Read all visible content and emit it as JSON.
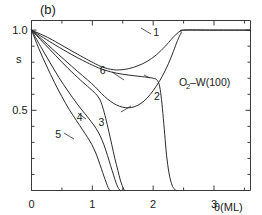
{
  "panel": {
    "label": "(b)"
  },
  "annotation": {
    "pre": "O",
    "sub": "2",
    "post": "–W(100)"
  },
  "axes": {
    "x": {
      "title": "θ(ML)",
      "ticks": [
        0,
        1,
        2,
        3
      ],
      "tick_labels": [
        "0",
        "1",
        "2",
        "3"
      ],
      "minor_ticks": [
        0.5,
        1.5,
        2.5,
        3.5
      ],
      "range": [
        0,
        3.6
      ]
    },
    "y": {
      "title": "s",
      "ticks": [
        0.5,
        1.0
      ],
      "tick_labels": [
        "0.5",
        "1.0"
      ],
      "minor_ticks": [
        0.1,
        0.2,
        0.3,
        0.4,
        0.6,
        0.7,
        0.8,
        0.9
      ],
      "range": [
        0,
        1.06
      ]
    }
  },
  "chart_data": {
    "type": "line",
    "title": "",
    "subtitle": "(b)",
    "xlabel": "θ(ML)",
    "ylabel": "s",
    "xlim": [
      0,
      3.6
    ],
    "ylim": [
      0,
      1.06
    ],
    "grid": false,
    "legend": "inline-curve-labels",
    "annotations": [
      "O2–W(100)",
      "(b)"
    ],
    "series": [
      {
        "name": "1",
        "label": "1",
        "label_x": 2.05,
        "label_y": 0.965,
        "points": [
          [
            0.0,
            1.0
          ],
          [
            0.15,
            0.975
          ],
          [
            0.3,
            0.948
          ],
          [
            0.5,
            0.905
          ],
          [
            0.7,
            0.862
          ],
          [
            0.9,
            0.82
          ],
          [
            1.05,
            0.79
          ],
          [
            1.15,
            0.772
          ],
          [
            1.25,
            0.76
          ],
          [
            1.35,
            0.753
          ],
          [
            1.45,
            0.752
          ],
          [
            1.6,
            0.76
          ],
          [
            1.75,
            0.778
          ],
          [
            1.9,
            0.805
          ],
          [
            2.05,
            0.845
          ],
          [
            2.2,
            0.9
          ],
          [
            2.3,
            0.943
          ],
          [
            2.38,
            0.975
          ],
          [
            2.45,
            0.995
          ],
          [
            2.5,
            1.0
          ],
          [
            3.0,
            1.0
          ],
          [
            3.6,
            1.0
          ]
        ]
      },
      {
        "name": "2",
        "label": "2",
        "label_x": 2.06,
        "label_y": 0.565,
        "points": [
          [
            0.0,
            1.0
          ],
          [
            0.2,
            0.952
          ],
          [
            0.4,
            0.905
          ],
          [
            0.65,
            0.85
          ],
          [
            0.9,
            0.8
          ],
          [
            1.1,
            0.765
          ],
          [
            1.3,
            0.74
          ],
          [
            1.5,
            0.725
          ],
          [
            1.7,
            0.715
          ],
          [
            1.9,
            0.706
          ],
          [
            2.0,
            0.7
          ],
          [
            2.06,
            0.69
          ],
          [
            2.1,
            0.66
          ],
          [
            2.13,
            0.59
          ],
          [
            2.16,
            0.48
          ],
          [
            2.19,
            0.35
          ],
          [
            2.22,
            0.22
          ],
          [
            2.26,
            0.11
          ],
          [
            2.3,
            0.045
          ],
          [
            2.34,
            0.012
          ],
          [
            2.38,
            0.0
          ]
        ]
      },
      {
        "name": "3",
        "label": "3",
        "label_x": 1.15,
        "label_y": 0.4,
        "points": [
          [
            0.0,
            1.0
          ],
          [
            0.2,
            0.92
          ],
          [
            0.4,
            0.84
          ],
          [
            0.6,
            0.762
          ],
          [
            0.8,
            0.69
          ],
          [
            0.95,
            0.64
          ],
          [
            1.05,
            0.605
          ],
          [
            1.12,
            0.57
          ],
          [
            1.17,
            0.52
          ],
          [
            1.22,
            0.45
          ],
          [
            1.27,
            0.37
          ],
          [
            1.32,
            0.285
          ],
          [
            1.37,
            0.2
          ],
          [
            1.42,
            0.125
          ],
          [
            1.46,
            0.065
          ],
          [
            1.5,
            0.022
          ],
          [
            1.53,
            0.0
          ]
        ]
      },
      {
        "name": "4",
        "label": "4",
        "label_x": 0.79,
        "label_y": 0.435,
        "points": [
          [
            0.0,
            1.0
          ],
          [
            0.15,
            0.898
          ],
          [
            0.3,
            0.8
          ],
          [
            0.45,
            0.705
          ],
          [
            0.6,
            0.62
          ],
          [
            0.75,
            0.54
          ],
          [
            0.88,
            0.478
          ],
          [
            0.98,
            0.43
          ],
          [
            1.06,
            0.388
          ],
          [
            1.13,
            0.34
          ],
          [
            1.19,
            0.285
          ],
          [
            1.25,
            0.218
          ],
          [
            1.3,
            0.155
          ],
          [
            1.35,
            0.095
          ],
          [
            1.39,
            0.048
          ],
          [
            1.43,
            0.013
          ],
          [
            1.46,
            0.0
          ]
        ]
      },
      {
        "name": "5",
        "label": "5",
        "label_x": 0.44,
        "label_y": 0.33,
        "points": [
          [
            0.0,
            1.0
          ],
          [
            0.12,
            0.885
          ],
          [
            0.25,
            0.775
          ],
          [
            0.38,
            0.672
          ],
          [
            0.5,
            0.585
          ],
          [
            0.62,
            0.505
          ],
          [
            0.74,
            0.435
          ],
          [
            0.84,
            0.378
          ],
          [
            0.92,
            0.332
          ],
          [
            0.99,
            0.288
          ],
          [
            1.05,
            0.24
          ],
          [
            1.1,
            0.19
          ],
          [
            1.15,
            0.135
          ],
          [
            1.19,
            0.09
          ],
          [
            1.23,
            0.048
          ],
          [
            1.26,
            0.018
          ],
          [
            1.29,
            0.0
          ]
        ]
      },
      {
        "name": "6",
        "label": "6",
        "label_x": 1.17,
        "label_y": 0.725,
        "points": [
          [
            0.0,
            1.0
          ],
          [
            0.18,
            0.94
          ],
          [
            0.35,
            0.88
          ],
          [
            0.55,
            0.812
          ],
          [
            0.75,
            0.745
          ],
          [
            0.92,
            0.69
          ],
          [
            1.05,
            0.645
          ],
          [
            1.15,
            0.605
          ],
          [
            1.25,
            0.57
          ],
          [
            1.35,
            0.543
          ],
          [
            1.45,
            0.525
          ],
          [
            1.55,
            0.516
          ],
          [
            1.65,
            0.518
          ],
          [
            1.75,
            0.532
          ],
          [
            1.85,
            0.558
          ],
          [
            1.95,
            0.598
          ],
          [
            2.05,
            0.65
          ],
          [
            2.15,
            0.712
          ],
          [
            2.25,
            0.79
          ],
          [
            2.33,
            0.865
          ],
          [
            2.4,
            0.935
          ],
          [
            2.46,
            0.982
          ],
          [
            2.5,
            1.0
          ],
          [
            3.0,
            1.0
          ],
          [
            3.6,
            1.0
          ]
        ]
      }
    ]
  }
}
